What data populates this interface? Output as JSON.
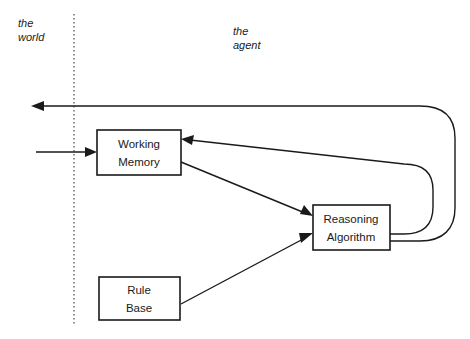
{
  "diagram": {
    "background_color": "#ffffff",
    "line_color": "#1a1a1a",
    "boundary_color": "#555555",
    "regions": [
      {
        "id": "world",
        "line1": "the",
        "line2": "world"
      },
      {
        "id": "agent",
        "line1": "the",
        "line2": "agent"
      }
    ],
    "boxes": [
      {
        "id": "working-memory",
        "line1": "Working",
        "line2": "Memory"
      },
      {
        "id": "reasoning-algorithm",
        "line1": "Reasoning",
        "line2": "Algorithm"
      },
      {
        "id": "rule-base",
        "line1": "Rule",
        "line2": "Base"
      }
    ],
    "connections": [
      {
        "id": "agent-to-world-output",
        "from": "reasoning-algorithm",
        "to": "world",
        "style": "curved"
      },
      {
        "id": "world-to-working-memory-input",
        "from": "world",
        "to": "working-memory",
        "style": "straight"
      },
      {
        "id": "reasoning-to-working-memory",
        "from": "reasoning-algorithm",
        "to": "working-memory",
        "style": "curved"
      },
      {
        "id": "working-memory-to-reasoning",
        "from": "working-memory",
        "to": "reasoning-algorithm",
        "style": "straight"
      },
      {
        "id": "rule-base-to-reasoning",
        "from": "rule-base",
        "to": "reasoning-algorithm",
        "style": "straight"
      }
    ]
  }
}
